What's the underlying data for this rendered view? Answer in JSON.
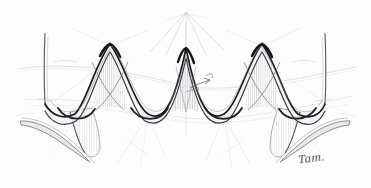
{
  "artwork": {
    "title": "Undulating Ribbon Surface Study",
    "medium": "pencil sketch",
    "subject": "continuous corrugated wave form in perspective",
    "background_color": "#fdfdfd",
    "ink_dark": "#1a1a1a",
    "ink_mid": "#4d4d55",
    "ink_light": "#9a9aa2",
    "guide_color": "#b9b9c2",
    "hatch_color": "#8a8a93",
    "canvas": {
      "width": 371,
      "height": 188
    }
  },
  "signature": {
    "text": "Tam.",
    "position": "bottom-right",
    "color": "#3a3a44"
  },
  "geometry": {
    "peaks_x": [
      110,
      186,
      262
    ],
    "troughs_x": [
      75,
      148,
      224,
      298
    ],
    "peak_y": 42,
    "trough_y": 112,
    "left_edge_x": 45,
    "right_edge_x": 325,
    "edge_top_y": 33,
    "edge_bottom_y": 118,
    "ribbon_thickness": 7
  },
  "annotations": {
    "arrow_label": "direction-arrow",
    "arrow_x": 200,
    "arrow_y": 84,
    "vanishing_point_top_x": 186,
    "vanishing_point_top_y": 12,
    "ray_count": 7
  },
  "guides": {
    "upper_arc_label": "upper perspective arc",
    "lower_arc_label": "lower perspective arc",
    "arc_color": "#c2c2ca"
  },
  "layers": [
    {
      "name": "perspective-guides",
      "label": "Perspective guide arcs"
    },
    {
      "name": "construction-rays",
      "label": "Radiating construction rays"
    },
    {
      "name": "lower-ribbon",
      "label": "Lower trailing ribbon"
    },
    {
      "name": "main-wave",
      "label": "Main undulating wave band"
    },
    {
      "name": "hatching",
      "label": "Vertical hatch shading"
    },
    {
      "name": "signature",
      "label": "Artist signature"
    }
  ]
}
